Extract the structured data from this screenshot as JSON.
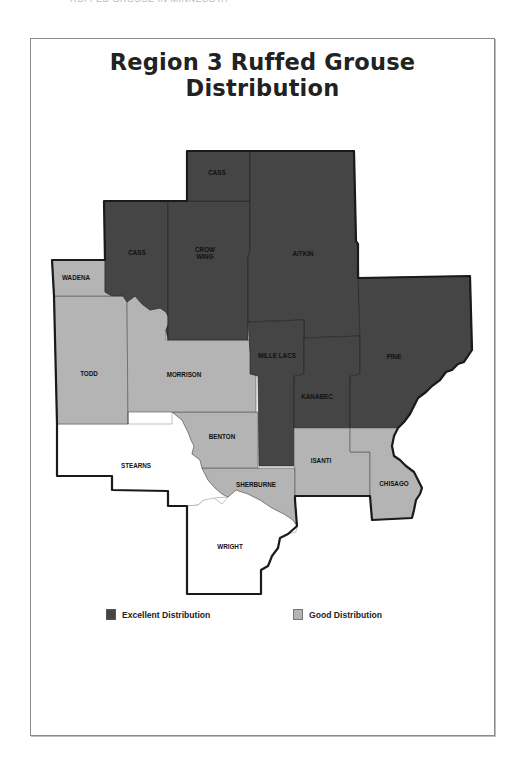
{
  "page": {
    "running_head": "RUFFED GROUSE IN MINNESOTA",
    "title": "Region 3 Ruffed Grouse Distribution"
  },
  "colors": {
    "excellent": "#454545",
    "good": "#b4b4b4",
    "none": "#ffffff",
    "border": "#1a1a1a"
  },
  "counties": [
    {
      "name": "CASS",
      "id": "cass-north",
      "category": "excellent"
    },
    {
      "name": "CASS",
      "id": "cass-west",
      "category": "excellent"
    },
    {
      "name": "CROW",
      "name_line2": "WING",
      "id": "crow-wing",
      "category": "excellent"
    },
    {
      "name": "AITKIN",
      "id": "aitkin",
      "category": "excellent"
    },
    {
      "name": "WADENA",
      "id": "wadena",
      "category": "good"
    },
    {
      "name": "TODD",
      "id": "todd",
      "category": "good"
    },
    {
      "name": "MORRISON",
      "id": "morrison",
      "category": "good"
    },
    {
      "name": "MILLE LACS",
      "id": "mille-lacs",
      "category": "excellent"
    },
    {
      "name": "KANABEC",
      "id": "kanabec",
      "category": "excellent"
    },
    {
      "name": "PINE",
      "id": "pine",
      "category": "excellent"
    },
    {
      "name": "BENTON",
      "id": "benton",
      "category": "good"
    },
    {
      "name": "STEARNS",
      "id": "stearns",
      "category": "none"
    },
    {
      "name": "SHERBURNE",
      "id": "sherburne",
      "category": "good"
    },
    {
      "name": "ISANTI",
      "id": "isanti",
      "category": "good"
    },
    {
      "name": "CHISAGO",
      "id": "chisago",
      "category": "good"
    },
    {
      "name": "WRIGHT",
      "id": "wright",
      "category": "none"
    }
  ],
  "legend": {
    "items": [
      {
        "label": "Excellent Distribution",
        "category": "excellent",
        "color": "#454545"
      },
      {
        "label": "Good Distribution",
        "category": "good",
        "color": "#b4b4b4"
      }
    ]
  }
}
